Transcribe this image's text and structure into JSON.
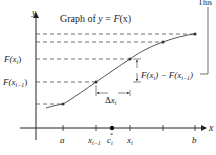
{
  "title": {
    "prefix": "Graph of ",
    "y": "y",
    "eq": " = ",
    "F": "F",
    "arg": "(x)"
  },
  "axes": {
    "x_label": "x",
    "y_label": "y"
  },
  "x_ticks": [
    {
      "id": "a",
      "label": "a"
    },
    {
      "id": "xim1",
      "label": "x",
      "sub": "i−1"
    },
    {
      "id": "ci",
      "label": "c",
      "sub": "i",
      "sup": "*"
    },
    {
      "id": "xi",
      "label": "x",
      "sub": "i"
    },
    {
      "id": "blank",
      "label": ""
    },
    {
      "id": "b",
      "label": "b"
    }
  ],
  "y_labels": {
    "F_xi": {
      "F": "F",
      "open": "(x",
      "sub": "i",
      "close": ")"
    },
    "F_xim1": {
      "F": "F",
      "open": "(x",
      "sub": "i−1",
      "close": ")"
    }
  },
  "annotations": {
    "delta": {
      "symbol": "Δ",
      "x": "x",
      "sub": "i"
    },
    "difference": {
      "part1": "F(x",
      "sub1": "i",
      "part2": ") − F(x",
      "sub2": "i−1",
      "part3": ")"
    },
    "truncated_label": "This"
  },
  "colors": {
    "ink": "#222222",
    "curve": "#555555",
    "dash": "#333333"
  }
}
